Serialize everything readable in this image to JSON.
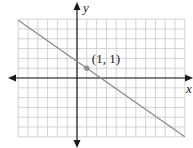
{
  "chart_data": {
    "type": "line",
    "title": "",
    "xlabel": "x",
    "ylabel": "y",
    "xlim": [
      -6,
      11
    ],
    "ylim": [
      -6,
      6
    ],
    "grid": true,
    "grid_step": 1,
    "series": [
      {
        "name": "line",
        "slope": -0.7,
        "intercept": 1.7,
        "x": [
          -6,
          11
        ],
        "y": [
          5.9,
          -6.0
        ]
      }
    ],
    "points": [
      {
        "x": 1,
        "y": 1,
        "label": "(1, 1)"
      }
    ]
  },
  "colors": {
    "grid": "#c8c8c8",
    "axis": "#1a1a1a",
    "line": "#8a8a8a",
    "point": "#8c8c8c"
  }
}
